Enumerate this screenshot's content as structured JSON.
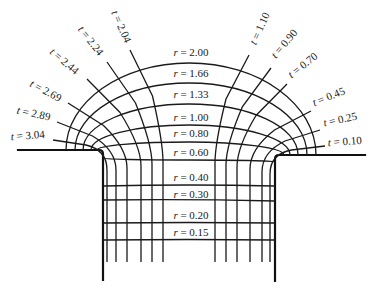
{
  "figure": {
    "r_curves": [
      {
        "label": "r = 2.00",
        "var": "r",
        "value": "2.00"
      },
      {
        "label": "r = 1.66",
        "var": "r",
        "value": "1.66"
      },
      {
        "label": "r = 1.33",
        "var": "r",
        "value": "1.33"
      },
      {
        "label": "r = 1.00",
        "var": "r",
        "value": "1.00"
      },
      {
        "label": "r = 0.80",
        "var": "r",
        "value": "0.80"
      },
      {
        "label": "r = 0.60",
        "var": "r",
        "value": "0.60"
      },
      {
        "label": "r = 0.40",
        "var": "r",
        "value": "0.40"
      },
      {
        "label": "r = 0.30",
        "var": "r",
        "value": "0.30"
      },
      {
        "label": "r = 0.20",
        "var": "r",
        "value": "0.20"
      },
      {
        "label": "r = 0.15",
        "var": "r",
        "value": "0.15"
      }
    ],
    "t_curves_left": [
      {
        "label": "t = 3.04",
        "var": "t",
        "value": "3.04"
      },
      {
        "label": "t = 2.89",
        "var": "t",
        "value": "2.89"
      },
      {
        "label": "t = 2.69",
        "var": "t",
        "value": "2.69"
      },
      {
        "label": "t = 2.44",
        "var": "t",
        "value": "2.44"
      },
      {
        "label": "t = 2.24",
        "var": "t",
        "value": "2.24"
      },
      {
        "label": "t = 2.04",
        "var": "t",
        "value": "2.04"
      }
    ],
    "t_curves_right": [
      {
        "label": "t = 1.10",
        "var": "t",
        "value": "1.10"
      },
      {
        "label": "t = 0.90",
        "var": "t",
        "value": "0.90"
      },
      {
        "label": "t = 0.70",
        "var": "t",
        "value": "0.70"
      },
      {
        "label": "t = 0.45",
        "var": "t",
        "value": "0.45"
      },
      {
        "label": "t = 0.25",
        "var": "t",
        "value": "0.25"
      },
      {
        "label": "t = 0.10",
        "var": "t",
        "value": "0.10"
      }
    ]
  }
}
